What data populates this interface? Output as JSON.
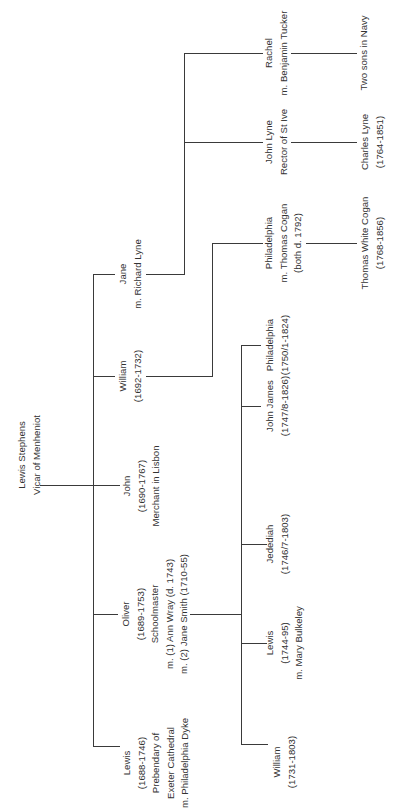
{
  "tree": {
    "root": {
      "name": "Lewis Stephens",
      "lines": [
        "Lewis Stephens",
        "Vicar of Menheniot"
      ]
    },
    "children": [
      {
        "id": "jane",
        "lines": [
          "Jane",
          "m. Richard Lyne"
        ]
      },
      {
        "id": "william",
        "lines": [
          "William",
          "(1692-1732)"
        ]
      },
      {
        "id": "john",
        "lines": [
          "John",
          "(1690-1767)",
          "Merchant in Lisbon"
        ]
      },
      {
        "id": "oliver",
        "lines": [
          "Oliver",
          "(1689-1753)",
          "Schoolmaster",
          "m. (1) Ann Wray (d. 1743)",
          "m. (2) Jane Smith (1710-55)"
        ]
      },
      {
        "id": "lewis",
        "lines": [
          "Lewis",
          "(1688-1746)",
          "Prebendary of",
          "Exeter Cathedral",
          "m. Philadelphia Dyke"
        ]
      }
    ],
    "jane_children": [
      {
        "id": "rachel",
        "lines": [
          "Rachel",
          "m. Benjamin Tucker"
        ]
      },
      {
        "id": "john_lyne",
        "lines": [
          "John Lyne",
          "Rector of St Ive"
        ]
      }
    ],
    "jane_grandchildren": [
      {
        "id": "two_sons",
        "parent": "rachel",
        "lines": [
          "Two sons in Navy"
        ]
      },
      {
        "id": "charles_lyne",
        "parent": "john_lyne",
        "lines": [
          "Charles Lyne",
          "(1764-1851)"
        ]
      }
    ],
    "william_children": [
      {
        "id": "philadelphia_cogan",
        "lines": [
          "Philadelphia",
          "m. Thomas Cogan",
          "(both d. 1792)"
        ]
      }
    ],
    "william_grandchildren": [
      {
        "id": "thomas_white_cogan",
        "lines": [
          "Thomas White Cogan",
          "(1768-1856)"
        ]
      }
    ],
    "oliver_children": [
      {
        "id": "philadelphia_o",
        "lines": [
          "Philadelphia",
          "(1750/1-1824)"
        ]
      },
      {
        "id": "john_james",
        "lines": [
          "John James",
          "(1747/8-1826)"
        ]
      },
      {
        "id": "jedediah",
        "lines": [
          "Jedediah",
          "(1746/7-1803)"
        ]
      },
      {
        "id": "lewis_o",
        "lines": [
          "Lewis",
          "(1744-95)",
          "m. Mary Bulkeley"
        ]
      },
      {
        "id": "william_o",
        "lines": [
          "William",
          "(1731-1803)"
        ]
      }
    ]
  },
  "colors": {
    "line": "#3a3a3a",
    "text": "#333333",
    "background": "#ffffff"
  }
}
